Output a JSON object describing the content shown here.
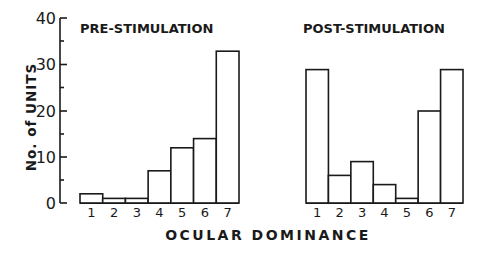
{
  "chart_data": [
    {
      "type": "bar",
      "title": "PRE-STIMULATION",
      "xlabel": "OCULAR DOMINANCE",
      "ylabel": "No. of UNITS",
      "categories": [
        "1",
        "2",
        "3",
        "4",
        "5",
        "6",
        "7"
      ],
      "values": [
        2,
        1,
        1,
        7,
        12,
        14,
        33
      ],
      "ylim": [
        0,
        40
      ],
      "yticks": [
        0,
        10,
        20,
        30,
        40
      ],
      "grid": false
    },
    {
      "type": "bar",
      "title": "POST-STIMULATION",
      "xlabel": "OCULAR DOMINANCE",
      "ylabel": "No. of UNITS",
      "categories": [
        "1",
        "2",
        "3",
        "4",
        "5",
        "6",
        "7"
      ],
      "values": [
        29,
        6,
        9,
        4,
        1,
        20,
        29
      ],
      "ylim": [
        0,
        40
      ],
      "grid": false
    }
  ],
  "labels": {
    "ylabel": "No. of UNITS",
    "xlabel": "OCULAR DOMINANCE",
    "pre_title": "PRE-STIMULATION",
    "post_title": "POST-STIMULATION",
    "yticks": [
      "0",
      "10",
      "20",
      "30",
      "40"
    ]
  }
}
